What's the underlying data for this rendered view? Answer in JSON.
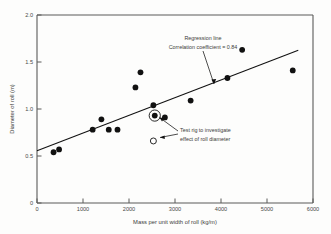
{
  "chart_data": {
    "type": "scatter",
    "title": "",
    "xlabel": "Mass per unit width of roll (kg/m)",
    "ylabel": "Diameter of roll (m)",
    "xlim": [
      0,
      6000
    ],
    "ylim": [
      0,
      2.0
    ],
    "xticks": [
      0,
      1000,
      2000,
      3000,
      4000,
      5000,
      6000
    ],
    "xtick_labels": [
      "0",
      "1000",
      "2000",
      "3000",
      "4000",
      "5000",
      "6000"
    ],
    "yticks": [
      0,
      0.5,
      1.0,
      1.5,
      2.0
    ],
    "ytick_labels": [
      "0",
      "0.5",
      "1.0",
      "1.5",
      "2.0"
    ],
    "grid": false,
    "legend": false,
    "series": [
      {
        "name": "Roll measurements",
        "marker": "filled-circle",
        "points": [
          {
            "x": 360,
            "y": 0.54
          },
          {
            "x": 480,
            "y": 0.57
          },
          {
            "x": 1210,
            "y": 0.78
          },
          {
            "x": 1400,
            "y": 0.89
          },
          {
            "x": 1560,
            "y": 0.78
          },
          {
            "x": 1750,
            "y": 0.78
          },
          {
            "x": 2140,
            "y": 1.23
          },
          {
            "x": 2250,
            "y": 1.39
          },
          {
            "x": 2530,
            "y": 1.04
          },
          {
            "x": 2560,
            "y": 0.93
          },
          {
            "x": 2780,
            "y": 0.91
          },
          {
            "x": 3340,
            "y": 1.09
          },
          {
            "x": 4140,
            "y": 1.33
          },
          {
            "x": 4460,
            "y": 1.63
          },
          {
            "x": 5560,
            "y": 1.41
          }
        ]
      },
      {
        "name": "Test rig",
        "marker": "open-circle",
        "points": [
          {
            "x": 2530,
            "y": 0.66
          }
        ]
      }
    ],
    "highlighted_point": {
      "x": 2560,
      "y": 0.93
    },
    "regression": {
      "label": "Regression line",
      "correlation_label": "Correlation coefficient = 0.84",
      "correlation_coefficient": 0.84,
      "x_start": 0,
      "y_start": 0.555,
      "x_end": 5680,
      "y_end": 1.625
    },
    "annotations": [
      {
        "name": "regression-annotation",
        "lines": [
          "Regression line",
          "Correlation coefficient = 0.84"
        ]
      },
      {
        "name": "test-rig-annotation",
        "lines": [
          "Test rig to investigate",
          "effect of roll diameter"
        ]
      }
    ]
  },
  "colors": {
    "background": "#fdfdfc",
    "axis": "#5a5a58",
    "marker": "#111111",
    "text": "#3c3c3a"
  }
}
